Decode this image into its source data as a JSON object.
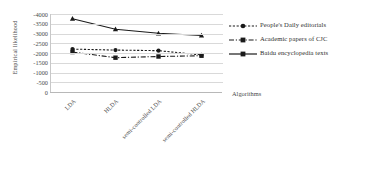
{
  "chart_data": {
    "type": "line",
    "title": "",
    "xlabel": "Algorithms",
    "ylabel": "Empirical likelihood",
    "categories": [
      "LDA",
      "HLDA",
      "semi-controlled LDA",
      "semi-controlled HLDA"
    ],
    "yticklabels": [
      "-4000",
      "-3500",
      "-3000",
      "-2500",
      "-2000",
      "-1500",
      "-1000",
      "-500",
      "0"
    ],
    "ytickvalues": [
      -4000,
      -3500,
      -3000,
      -2500,
      -2000,
      -1500,
      -1000,
      -500,
      0
    ],
    "ylim": [
      -4000,
      0
    ],
    "y_axis_inverted": true,
    "grid": true,
    "legend_position": "right",
    "series": [
      {
        "name": "People's Daily editorials",
        "values": [
          -2200,
          -2150,
          -2120,
          -1900
        ],
        "marker": "circle",
        "linestyle": "dotted",
        "color": "#1a1a1a"
      },
      {
        "name": "Academic papers of CJC",
        "values": [
          -2050,
          -1760,
          -1820,
          -1860
        ],
        "marker": "square",
        "linestyle": "dash-dot",
        "color": "#1a1a1a"
      },
      {
        "name": "Baidu encyclopedia texts",
        "values": [
          -3760,
          -3220,
          -3010,
          -2900
        ],
        "marker": "triangle",
        "linestyle": "solid",
        "color": "#1a1a1a"
      }
    ]
  },
  "colors": {
    "series": "#1a1a1a",
    "grid": "#d9d9d9",
    "axis": "#b8b8b8",
    "text": "#4a4a4a",
    "background": "#ffffff"
  }
}
